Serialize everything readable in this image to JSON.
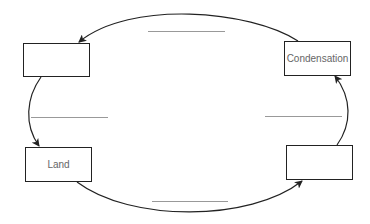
{
  "diagram": {
    "title": "",
    "type": "cycle",
    "boxes": {
      "top_left": {
        "label": ""
      },
      "top_right": {
        "label": "Condensation"
      },
      "bottom_left": {
        "label": "Land"
      },
      "bottom_right": {
        "label": ""
      }
    },
    "blanks": {
      "top": "",
      "left": "",
      "right": "",
      "bottom": ""
    },
    "arrows": [
      {
        "from": "top_right",
        "to": "top_left"
      },
      {
        "from": "top_left",
        "to": "bottom_left"
      },
      {
        "from": "bottom_left",
        "to": "bottom_right"
      },
      {
        "from": "bottom_right",
        "to": "top_right"
      }
    ],
    "colors": {
      "stroke": "#222222",
      "blank_line": "#999999",
      "label": "#666666"
    }
  }
}
